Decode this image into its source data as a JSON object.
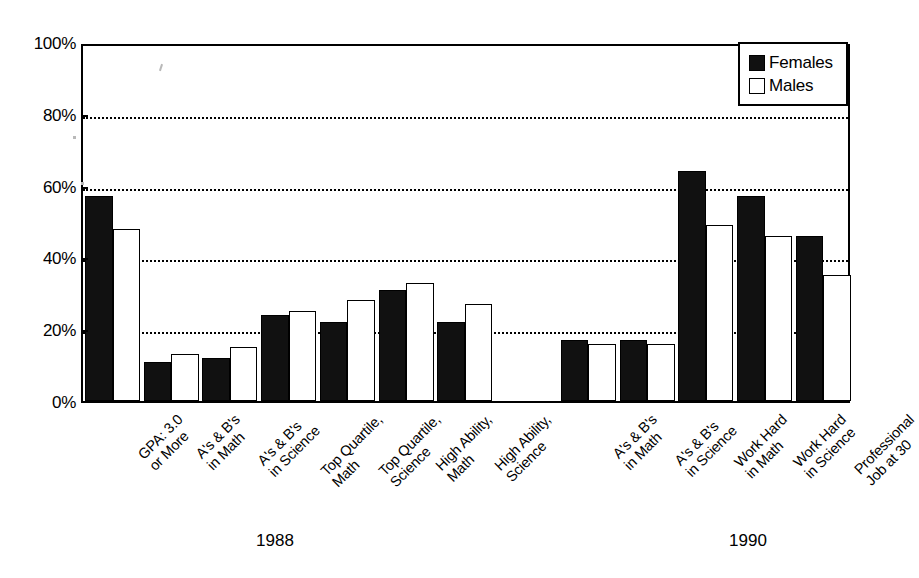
{
  "chart_data": {
    "type": "bar",
    "title": "",
    "xlabel": "",
    "ylabel": "",
    "ylim": [
      0,
      100
    ],
    "ytick_labels": [
      "0%",
      "20%",
      "40%",
      "60%",
      "80%",
      "100%"
    ],
    "ytick_values": [
      0,
      20,
      40,
      60,
      80,
      100
    ],
    "grid": "horizontal-dotted",
    "legend_position": "top-right",
    "legend": [
      "Females",
      "Males"
    ],
    "group_labels": [
      "1988",
      "1990"
    ],
    "categories": [
      "GPA: 3.0\nor More",
      "A's & B's\nin Math",
      "A's & B's\nin Science",
      "Top Quartile,\nMath",
      "Top Quartile,\nScience",
      "High Ability,\nMath",
      "High Ability,\nScience",
      "A's & B's\nin Math",
      "A's & B's\nin Science",
      "Work Hard\nin Math",
      "Work Hard\nin Science",
      "Professional\nJob at 30"
    ],
    "category_groups": [
      "1988",
      "1988",
      "1988",
      "1988",
      "1988",
      "1988",
      "1988",
      "1990",
      "1990",
      "1990",
      "1990",
      "1990"
    ],
    "series": [
      {
        "name": "Females",
        "color": "#111111",
        "values": [
          57,
          11,
          12,
          24,
          22,
          31,
          22,
          17,
          17,
          64,
          57,
          46
        ]
      },
      {
        "name": "Males",
        "color": "#ffffff",
        "values": [
          48,
          13,
          15,
          25,
          28,
          33,
          27,
          16,
          16,
          49,
          46,
          35
        ]
      }
    ]
  },
  "legend": {
    "females_label": "Females",
    "males_label": "Males"
  },
  "axis": {
    "ticks": [
      {
        "label": "100%",
        "value": 100
      },
      {
        "label": "80%",
        "value": 80
      },
      {
        "label": "60%",
        "value": 60
      },
      {
        "label": "40%",
        "value": 40
      },
      {
        "label": "20%",
        "value": 20
      },
      {
        "label": "0%",
        "value": 0
      }
    ]
  },
  "groups": [
    {
      "label": "1988",
      "center_x": 275
    },
    {
      "label": "1990",
      "center_x": 748
    }
  ]
}
